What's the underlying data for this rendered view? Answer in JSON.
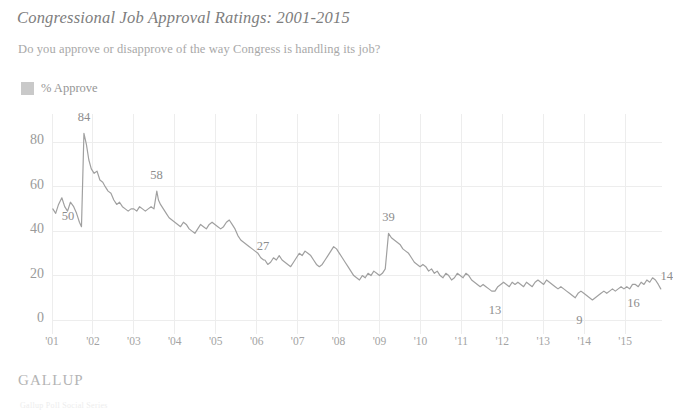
{
  "header": {
    "title": "Congressional Job Approval Ratings: 2001-2015",
    "subtitle": "Do you approve or disapprove of the way Congress is handling its job?"
  },
  "legend": {
    "position": "top-left",
    "swatch_color": "#c9c9c9",
    "items": [
      {
        "label": "% Approve",
        "color": "#c9c9c9",
        "icon": "square-swatch-icon"
      }
    ]
  },
  "footer": {
    "source_logo": "GALLUP",
    "fragment": "Gallup Poll Social Series"
  },
  "colors": {
    "line": "#a0a0a0",
    "grid": "#ededed",
    "text": "#9a9a9a",
    "title": "#7d7d7d",
    "background": "#ffffff"
  },
  "chart_data": {
    "type": "line",
    "title": "Congressional Job Approval Ratings: 2001-2015",
    "subtitle": "Do you approve or disapprove of the way Congress is handling its job?",
    "xlabel": "",
    "ylabel": "",
    "ylim": [
      0,
      90
    ],
    "yticks": [
      0,
      20,
      40,
      60,
      80
    ],
    "ytick_labels": [
      "0",
      "20",
      "40",
      "60",
      "80"
    ],
    "xlim": [
      2001.0,
      2015.9
    ],
    "xticks": [
      2001,
      2002,
      2003,
      2004,
      2005,
      2006,
      2007,
      2008,
      2009,
      2010,
      2011,
      2012,
      2013,
      2014,
      2015
    ],
    "xtick_labels": [
      "'01",
      "'02",
      "'03",
      "'04",
      "'05",
      "'06",
      "'07",
      "'08",
      "'09",
      "'10",
      "'11",
      "'12",
      "'13",
      "'14",
      "'15"
    ],
    "grid": true,
    "legend_position": "above-plot-left",
    "annotations": [
      {
        "label": "50",
        "x": 2001.05,
        "y": 50,
        "dx": 14,
        "dy": 8
      },
      {
        "label": "84",
        "x": 2001.78,
        "y": 84,
        "dx": 0,
        "dy": -15
      },
      {
        "label": "58",
        "x": 2003.6,
        "y": 58,
        "dx": -2,
        "dy": -15
      },
      {
        "label": "27",
        "x": 2006.2,
        "y": 27,
        "dx": -2,
        "dy": -13
      },
      {
        "label": "39",
        "x": 2009.22,
        "y": 39,
        "dx": 0,
        "dy": -15
      },
      {
        "label": "13",
        "x": 2011.82,
        "y": 13,
        "dx": 0,
        "dy": 20
      },
      {
        "label": "9",
        "x": 2013.88,
        "y": 9,
        "dx": 0,
        "dy": 21
      },
      {
        "label": "16",
        "x": 2015.25,
        "y": 16,
        "dx": -2,
        "dy": 20
      },
      {
        "label": "14",
        "x": 2015.87,
        "y": 14,
        "dx": 6,
        "dy": -12
      }
    ],
    "series": [
      {
        "name": "% Approve",
        "color": "#a0a0a0",
        "x": [
          2001.02,
          2001.09,
          2001.16,
          2001.24,
          2001.31,
          2001.38,
          2001.45,
          2001.53,
          2001.6,
          2001.67,
          2001.72,
          2001.78,
          2001.84,
          2001.9,
          2001.96,
          2002.03,
          2002.1,
          2002.17,
          2002.24,
          2002.3,
          2002.37,
          2002.44,
          2002.51,
          2002.58,
          2002.65,
          2002.72,
          2002.79,
          2002.86,
          2002.93,
          2003.0,
          2003.07,
          2003.14,
          2003.21,
          2003.28,
          2003.35,
          2003.42,
          2003.49,
          2003.56,
          2003.6,
          2003.65,
          2003.72,
          2003.79,
          2003.86,
          2003.93,
          2004.0,
          2004.07,
          2004.14,
          2004.21,
          2004.28,
          2004.35,
          2004.42,
          2004.49,
          2004.56,
          2004.63,
          2004.7,
          2004.77,
          2004.84,
          2004.91,
          2004.98,
          2005.05,
          2005.12,
          2005.19,
          2005.26,
          2005.33,
          2005.4,
          2005.47,
          2005.54,
          2005.61,
          2005.68,
          2005.75,
          2005.82,
          2005.89,
          2005.96,
          2006.03,
          2006.1,
          2006.17,
          2006.2,
          2006.27,
          2006.34,
          2006.41,
          2006.48,
          2006.55,
          2006.62,
          2006.69,
          2006.76,
          2006.83,
          2006.9,
          2006.97,
          2007.04,
          2007.11,
          2007.18,
          2007.25,
          2007.32,
          2007.39,
          2007.46,
          2007.53,
          2007.6,
          2007.67,
          2007.74,
          2007.81,
          2007.88,
          2007.95,
          2008.02,
          2008.09,
          2008.16,
          2008.23,
          2008.3,
          2008.37,
          2008.44,
          2008.51,
          2008.58,
          2008.65,
          2008.72,
          2008.79,
          2008.86,
          2008.93,
          2009.0,
          2009.07,
          2009.14,
          2009.22,
          2009.29,
          2009.36,
          2009.43,
          2009.5,
          2009.57,
          2009.64,
          2009.71,
          2009.78,
          2009.85,
          2009.92,
          2009.99,
          2010.06,
          2010.13,
          2010.2,
          2010.27,
          2010.34,
          2010.41,
          2010.48,
          2010.55,
          2010.62,
          2010.69,
          2010.76,
          2010.83,
          2010.9,
          2010.97,
          2011.04,
          2011.11,
          2011.18,
          2011.25,
          2011.32,
          2011.39,
          2011.46,
          2011.53,
          2011.6,
          2011.67,
          2011.74,
          2011.82,
          2011.89,
          2011.96,
          2012.03,
          2012.1,
          2012.17,
          2012.24,
          2012.31,
          2012.38,
          2012.45,
          2012.52,
          2012.59,
          2012.66,
          2012.73,
          2012.8,
          2012.87,
          2012.94,
          2013.01,
          2013.08,
          2013.15,
          2013.22,
          2013.29,
          2013.36,
          2013.43,
          2013.5,
          2013.57,
          2013.64,
          2013.71,
          2013.78,
          2013.85,
          2013.92,
          2013.99,
          2014.06,
          2014.13,
          2014.2,
          2014.27,
          2014.34,
          2014.41,
          2014.48,
          2014.55,
          2014.62,
          2014.69,
          2014.76,
          2014.83,
          2014.9,
          2014.97,
          2015.04,
          2015.11,
          2015.18,
          2015.25,
          2015.32,
          2015.39,
          2015.46,
          2015.53,
          2015.6,
          2015.67,
          2015.74,
          2015.81,
          2015.87
        ],
        "y": [
          50,
          48,
          52,
          55,
          51,
          49,
          53,
          51,
          48,
          44,
          42,
          84,
          79,
          72,
          68,
          66,
          67,
          63,
          62,
          60,
          58,
          57,
          54,
          52,
          53,
          51,
          50,
          49,
          50,
          50,
          49,
          51,
          50,
          49,
          50,
          51,
          50,
          58,
          54,
          52,
          50,
          48,
          46,
          45,
          44,
          43,
          42,
          44,
          43,
          41,
          40,
          39,
          41,
          43,
          42,
          41,
          43,
          44,
          43,
          42,
          41,
          42,
          44,
          45,
          43,
          41,
          38,
          36,
          35,
          34,
          33,
          32,
          31,
          30,
          28,
          27,
          27,
          25,
          26,
          28,
          27,
          29,
          27,
          26,
          25,
          24,
          26,
          28,
          30,
          29,
          31,
          30,
          29,
          27,
          25,
          24,
          25,
          27,
          29,
          31,
          33,
          32,
          30,
          28,
          26,
          24,
          22,
          20,
          19,
          18,
          20,
          19,
          21,
          20,
          22,
          21,
          20,
          21,
          23,
          39,
          37,
          36,
          35,
          34,
          32,
          31,
          30,
          28,
          26,
          25,
          24,
          25,
          24,
          22,
          23,
          21,
          22,
          20,
          19,
          21,
          20,
          18,
          19,
          21,
          20,
          19,
          21,
          20,
          18,
          17,
          16,
          15,
          16,
          15,
          14,
          13,
          13,
          15,
          16,
          17,
          16,
          15,
          17,
          16,
          17,
          16,
          15,
          17,
          16,
          15,
          17,
          18,
          17,
          16,
          18,
          17,
          16,
          15,
          14,
          15,
          14,
          13,
          12,
          11,
          10,
          12,
          13,
          12,
          11,
          10,
          9,
          10,
          11,
          12,
          13,
          12,
          13,
          14,
          13,
          14,
          15,
          14,
          15,
          14,
          16,
          16,
          15,
          17,
          16,
          18,
          17,
          19,
          18,
          16,
          14
        ]
      }
    ]
  }
}
